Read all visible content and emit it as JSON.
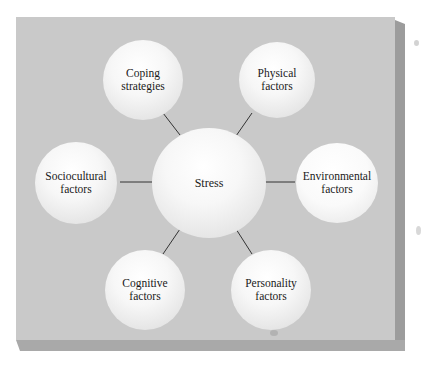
{
  "diagram": {
    "center": {
      "label": "Stress"
    },
    "nodes": [
      {
        "id": "coping",
        "line1": "Coping",
        "line2": "strategies"
      },
      {
        "id": "physical",
        "line1": "Physical",
        "line2": "factors"
      },
      {
        "id": "sociocultural",
        "line1": "Sociocultural",
        "line2": "factors"
      },
      {
        "id": "environmental",
        "line1": "Environmental",
        "line2": "factors"
      },
      {
        "id": "cognitive",
        "line1": "Cognitive",
        "line2": "factors"
      },
      {
        "id": "personality",
        "line1": "Personality",
        "line2": "factors"
      }
    ],
    "colors": {
      "panel": "#c9c9c9",
      "panel_side": "#9c9c9c",
      "panel_bottom": "#a9a9a9",
      "connector": "#333333",
      "text": "#1a1a1a"
    }
  }
}
